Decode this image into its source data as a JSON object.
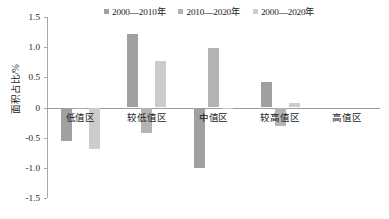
{
  "chart_data": {
    "type": "bar",
    "title": "",
    "xlabel": "",
    "ylabel": "面积占比/%",
    "ylim": [
      -1.5,
      1.5
    ],
    "yticks": [
      "1.5",
      "1.0",
      "0.5",
      "0",
      "-0.5",
      "-1.0",
      "-1.5"
    ],
    "ytick_values": [
      1.5,
      1.0,
      0.5,
      0,
      -0.5,
      -1.0,
      -1.5
    ],
    "grid": false,
    "legend_position": "top-center",
    "categories": [
      "低值区",
      "较低值区",
      "中值区",
      "较高值区",
      "高值区"
    ],
    "series": [
      {
        "name": "2000—2010年",
        "color": "#a0a0a0",
        "values": [
          -0.55,
          1.21,
          -1.0,
          0.43,
          0.0
        ]
      },
      {
        "name": "2010—2020年",
        "color": "#b4b4b4",
        "values": [
          -0.01,
          -0.43,
          0.98,
          -0.3,
          0.0
        ]
      },
      {
        "name": "2000—2020年",
        "color": "#cccccc",
        "values": [
          -0.69,
          0.77,
          -0.03,
          0.07,
          0.0
        ]
      }
    ]
  },
  "axis": {
    "y_title": "面积占比/%",
    "line_color": "#a8a8a8",
    "zero_line_color": "#9a9a9a"
  }
}
